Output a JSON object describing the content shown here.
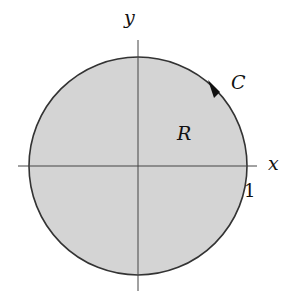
{
  "diagram": {
    "colors": {
      "region_fill": "#d4d4d4",
      "boundary_stroke": "#333333",
      "axis_stroke": "#444444",
      "text": "#111111"
    },
    "labels": {
      "x_axis": "x",
      "y_axis": "y",
      "curve": "C",
      "region": "R",
      "radius_tick": "1"
    },
    "circle": {
      "cx": 138,
      "cy": 166,
      "r": 109
    },
    "orientation": "counterclockwise"
  }
}
